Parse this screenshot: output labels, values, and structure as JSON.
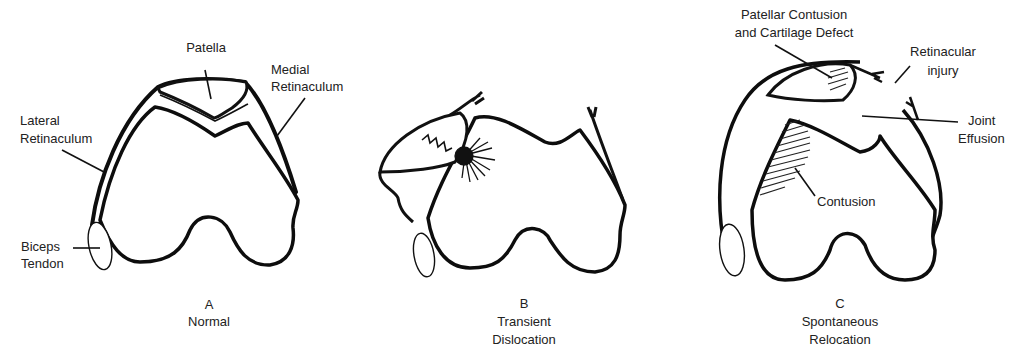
{
  "panels": [
    {
      "letter": "A",
      "caption": "Normal",
      "labels": {
        "patella": "Patella",
        "medial_retinaculum_1": "Medial",
        "medial_retinaculum_2": "Retinaculum",
        "lateral_retinaculum_1": "Lateral",
        "lateral_retinaculum_2": "Retinaculum",
        "biceps_tendon_1": "Biceps",
        "biceps_tendon_2": "Tendon"
      }
    },
    {
      "letter": "B",
      "caption_1": "Transient",
      "caption_2": "Dislocation"
    },
    {
      "letter": "C",
      "caption_1": "Spontaneous",
      "caption_2": "Relocation",
      "labels": {
        "patellar_contusion_1": "Patellar Contusion",
        "patellar_contusion_2": "and Cartilage Defect",
        "retinacular_injury_1": "Retinacular",
        "retinacular_injury_2": "injury",
        "joint_effusion_1": "Joint",
        "joint_effusion_2": "Effusion",
        "contusion": "Contusion"
      }
    }
  ]
}
